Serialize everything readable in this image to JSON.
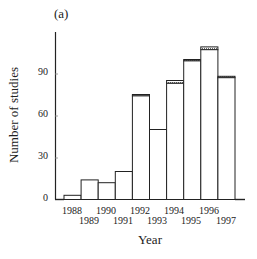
{
  "panel_label": "(a)",
  "chart_data": {
    "type": "bar",
    "title": "",
    "panel": "(a)",
    "xlabel": "Year",
    "ylabel": "Number of studies",
    "categories": [
      "1988",
      "1989",
      "1990",
      "1991",
      "1992",
      "1993",
      "1994",
      "1995",
      "1996",
      "1997"
    ],
    "values": [
      3,
      14,
      12,
      20,
      75,
      50,
      85,
      100,
      109,
      88
    ],
    "series": [
      {
        "name": "studies (solid)",
        "values": [
          3,
          14,
          12,
          20,
          74,
          50,
          83,
          99,
          107,
          87
        ]
      },
      {
        "name": "studies (hatched cap)",
        "values": [
          0,
          0,
          0,
          0,
          1,
          0,
          2,
          1,
          2,
          1
        ]
      }
    ],
    "yticks": [
      0,
      30,
      60,
      90
    ],
    "ylim": [
      0,
      120
    ],
    "grid": false,
    "legend": null,
    "bar_style": "outlined white bars with hatched top caps"
  },
  "axes": {
    "yticks": [
      "0",
      "30",
      "60",
      "90"
    ],
    "xticks": [
      "1988",
      "1989",
      "1990",
      "1991",
      "1992",
      "1993",
      "1994",
      "1995",
      "1996",
      "1997"
    ]
  }
}
